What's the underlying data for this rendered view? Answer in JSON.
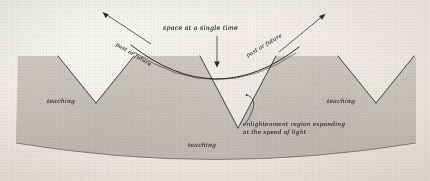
{
  "figure": {
    "kind": "hand-drawn-spacetime-diagram",
    "medium": "pencil and ink on textured paper",
    "background_color": "#efece6",
    "ink_color": "#2b2a28",
    "shade_color": "#b9b6af"
  },
  "labels": {
    "space_at_single_time": "space at a single time",
    "past_or_future_left": "past or future",
    "past_or_future_right": "past or future",
    "teaching_left": "teaching",
    "teaching_center": "teaching",
    "teaching_right": "teaching",
    "enlightenment_line1": "enlightenment region expanding",
    "enlightenment_line2": "at the speed of light"
  },
  "elements": {
    "light_cone_count": 3,
    "shaded_region_name": "enlightenment region",
    "center_curve_name": "space-at-a-single-time curve",
    "down_arrow_name": "space-curve-pointer",
    "up_arrow_left_name": "past-or-future-arrow-left",
    "up_arrow_right_name": "past-or-future-arrow-right",
    "arc_pointer_name": "enlightenment-arc-pointer"
  }
}
